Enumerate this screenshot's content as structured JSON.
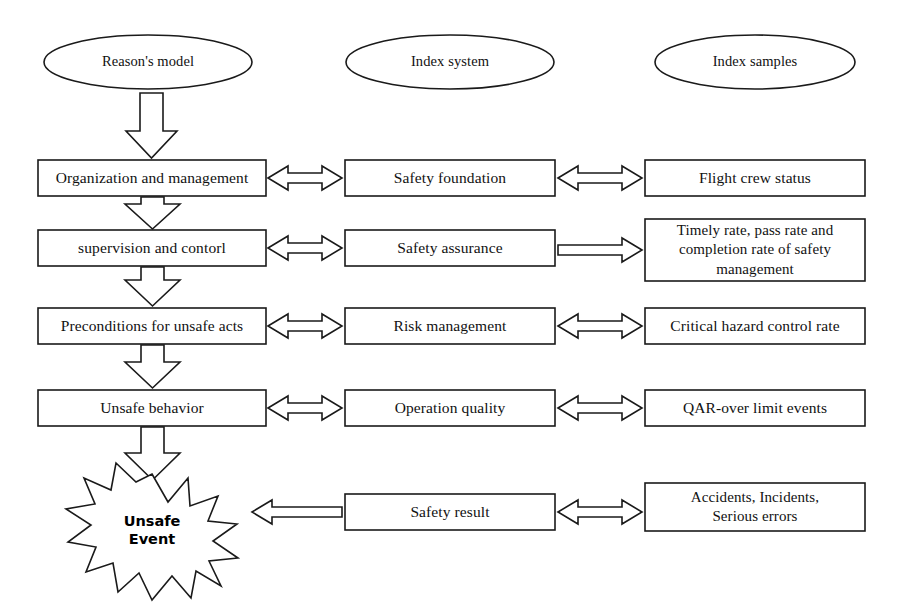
{
  "diagram": {
    "stroke_color": "#1a1a1a",
    "fill_color": "#ffffff",
    "background": "#ffffff",
    "columns": [
      {
        "id": "reason-model",
        "header": "Reason's model"
      },
      {
        "id": "index-system",
        "header": "Index system"
      },
      {
        "id": "index-samples",
        "header": "Index samples"
      }
    ],
    "rows": [
      {
        "id": "row-1",
        "model": "Organization and management",
        "system": "Safety foundation",
        "sample": "Flight crew status",
        "link_model_system": "double-arrow",
        "link_system_sample": "double-arrow"
      },
      {
        "id": "row-2",
        "model": "supervision and contorl",
        "system": "Safety assurance",
        "sample": "Timely rate, pass rate and completion rate of safety management",
        "sample_lines": [
          "Timely rate, pass rate and",
          "completion rate of safety",
          "management"
        ],
        "link_model_system": "double-arrow",
        "link_system_sample": "right-arrow"
      },
      {
        "id": "row-3",
        "model": "Preconditions for unsafe acts",
        "system": "Risk management",
        "sample": "Critical hazard control rate",
        "link_model_system": "double-arrow",
        "link_system_sample": "double-arrow"
      },
      {
        "id": "row-4",
        "model": "Unsafe  behavior",
        "system": "Operation quality",
        "sample": "QAR-over limit events",
        "link_model_system": "double-arrow",
        "link_system_sample": "double-arrow"
      },
      {
        "id": "row-5",
        "model": "Unsafe Event",
        "model_lines": [
          "Unsafe",
          "Event"
        ],
        "model_shape": "starburst",
        "system": "Safety result",
        "sample": "Accidents, Incidents, Serious errors",
        "sample_lines": [
          "Accidents, Incidents,",
          "Serious errors"
        ],
        "link_model_system": "left-arrow",
        "link_system_sample": "double-arrow"
      }
    ],
    "vertical_flow": [
      {
        "from": "Organization and management",
        "to": "supervision and contorl",
        "style": "block-arrow-down"
      },
      {
        "from": "supervision and contorl",
        "to": "Preconditions for unsafe acts",
        "style": "block-arrow-down"
      },
      {
        "from": "Preconditions for unsafe acts",
        "to": "Unsafe  behavior",
        "style": "block-arrow-down"
      },
      {
        "from": "Unsafe  behavior",
        "to": "Unsafe Event",
        "style": "block-arrow-down"
      },
      {
        "from": "Reason's model",
        "to": "Organization and management",
        "style": "block-arrow-down"
      }
    ]
  }
}
